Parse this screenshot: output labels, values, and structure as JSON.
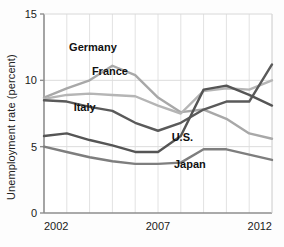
{
  "chart_data": {
    "type": "line",
    "title": "",
    "xlabel": "",
    "ylabel": "Unemployment rate (percent)",
    "xlim": [
      2002,
      2012
    ],
    "ylim": [
      0,
      15
    ],
    "yticks": [
      0,
      5,
      10,
      15
    ],
    "ytick_labels": [
      "0",
      "5",
      "10",
      "15"
    ],
    "xticks": [
      2002,
      2007,
      2012
    ],
    "xtick_labels": [
      "2002",
      "2007",
      "2012"
    ],
    "x": [
      2002,
      2003,
      2004,
      2005,
      2006,
      2007,
      2008,
      2009,
      2010,
      2011,
      2012
    ],
    "grid": "vertical-yearly-plus-horizontal-at-5-10",
    "legend": "inline-labels",
    "series": [
      {
        "name": "Germany",
        "color": "#a8a8a8",
        "label_x": 2003.1,
        "label_y": 12.2,
        "values": [
          8.7,
          9.4,
          10.0,
          11.1,
          10.4,
          8.7,
          7.6,
          7.8,
          7.1,
          6.0,
          5.6
        ]
      },
      {
        "name": "France",
        "color": "#b5b5b5",
        "label_x": 2004.1,
        "label_y": 10.4,
        "values": [
          8.6,
          8.9,
          9.0,
          8.9,
          8.8,
          8.1,
          7.5,
          9.2,
          9.4,
          9.3,
          10.0
        ]
      },
      {
        "name": "Italy",
        "color": "#5a5a5a",
        "label_x": 2003.3,
        "label_y": 7.7,
        "values": [
          8.5,
          8.4,
          8.0,
          7.7,
          6.8,
          6.2,
          6.8,
          7.8,
          8.4,
          8.4,
          11.2
        ]
      },
      {
        "name": "U.S.",
        "color": "#555555",
        "label_x": 2007.6,
        "label_y": 5.4,
        "values": [
          5.8,
          6.0,
          5.5,
          5.1,
          4.6,
          4.6,
          5.8,
          9.3,
          9.6,
          8.9,
          8.1
        ]
      },
      {
        "name": "Japan",
        "color": "#7e7e7e",
        "label_x": 2007.7,
        "label_y": 3.4,
        "values": [
          5.0,
          4.6,
          4.2,
          3.9,
          3.7,
          3.7,
          3.8,
          4.8,
          4.8,
          4.4,
          4.0
        ]
      }
    ]
  },
  "axis": {
    "ylabel": "Unemployment rate (percent)"
  },
  "caption": {
    "text": ""
  }
}
